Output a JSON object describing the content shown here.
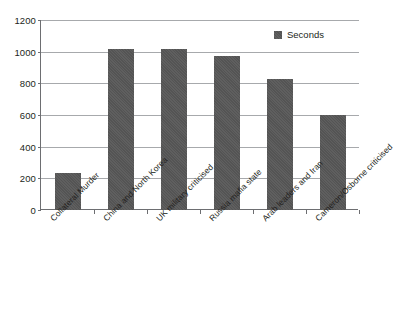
{
  "chart_data": {
    "type": "bar",
    "title": "",
    "subtitle": "",
    "xlabel": "",
    "ylabel": "",
    "categories": [
      "Collateral Murder",
      "China and North Korea",
      "UK military criticised",
      "Russia mafia state",
      "Arab leaders and Iran",
      "Cameron/Osborne criticised"
    ],
    "series": [
      {
        "name": "Seconds",
        "values": [
          235,
          1020,
          1020,
          970,
          830,
          600
        ],
        "color": "#585858"
      }
    ],
    "values": [
      235,
      1020,
      1020,
      970,
      830,
      600
    ],
    "ylim": [
      0,
      1200
    ],
    "ytick_step": 200,
    "yticks": [
      0,
      200,
      400,
      600,
      800,
      1000,
      1200
    ],
    "ytick_labels": [
      "0",
      "200",
      "400",
      "600",
      "800",
      "1000",
      "1200"
    ],
    "grid": true,
    "grid_axis": "y",
    "grid_color": "#a7a9ac",
    "axis_color": "#6d6e71",
    "background_color": "#ffffff",
    "legend": {
      "position": "top-right",
      "entries": [
        {
          "label": "Seconds",
          "color": "#585858",
          "swatch": "legend-swatch-icon"
        }
      ]
    },
    "xtick_label_rotation": -45
  }
}
